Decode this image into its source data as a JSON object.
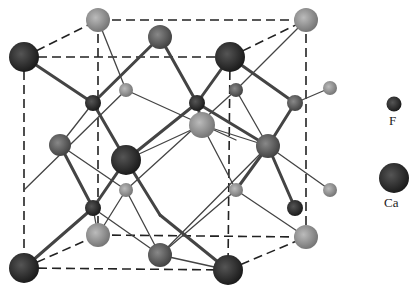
{
  "diagram": {
    "legend": [
      {
        "label": "F",
        "color": "#333333",
        "size": "small"
      },
      {
        "label": "Ca",
        "color": "#2a2a2a",
        "size": "large"
      }
    ]
  }
}
